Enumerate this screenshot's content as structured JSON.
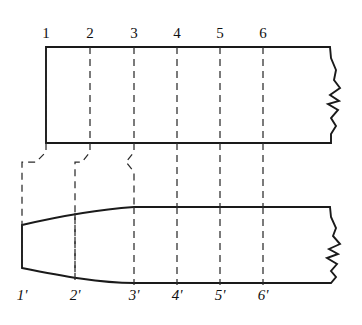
{
  "figure": {
    "line_color": "#1a1a1a",
    "dash_color": "#2b2b2b",
    "background": "#ffffff"
  },
  "top_view": {
    "name": "plan-view",
    "left_x": 46,
    "right_break_x": 330,
    "top_y": 47,
    "bottom_y": 143,
    "outline_path": "M46,47 L330,47 L331,58 L336,70 L334,80 L340,88 L330,95 L339,101 L328,104 L338,110 L331,118 L336,126 L331,134 L331,143 L46,143 Z",
    "station_labels": [
      "1",
      "2",
      "3",
      "4",
      "5",
      "6"
    ],
    "station_x": [
      46,
      90,
      134,
      177,
      220,
      263
    ],
    "label_y": 38
  },
  "bottom_view": {
    "name": "side-profile-view",
    "nose_x": 22,
    "nose_top_y": 225,
    "nose_bottom_y": 268,
    "body_top_y": 207,
    "body_bottom_y": 283,
    "taper_end_x": 134,
    "right_break_x": 330,
    "outline_path": "M22,225 C52,218 92,210 134,207 L330,207 L331,217 L336,228 L333,236 L340,244 L329,249 L338,254 L327,258 L337,264 L331,271 L336,277 L331,283 L134,283 C100,283 62,276 22,268 Z",
    "station_labels": [
      "1'",
      "2'",
      "3'",
      "4'",
      "5'",
      "6'"
    ],
    "station_x": [
      22,
      75,
      134,
      177,
      220,
      263
    ],
    "label_y": 300
  },
  "projection_lines": {
    "name": "stepped-projection-lines",
    "note": "Dashed station lines run through both views; between the views the three leftmost lines jog (step) sideways because the station positions shift in the tapered side view.",
    "straight_station_x": [
      177,
      220,
      263
    ],
    "jogged": [
      {
        "top_x": 46,
        "bottom_x": 22,
        "step_top_y": 152,
        "step_bottom_y": 172
      },
      {
        "top_x": 90,
        "bottom_x": 75,
        "step_top_y": 152,
        "step_bottom_y": 172
      },
      {
        "top_x": 134,
        "bottom_x": 134,
        "step_top_y": 152,
        "step_bottom_y": 172
      }
    ]
  }
}
